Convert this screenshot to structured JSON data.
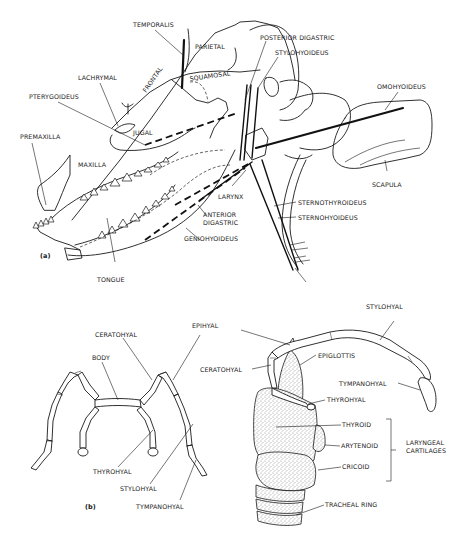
{
  "figure": {
    "panel_a": {
      "tag": "(a)",
      "labels": {
        "temporalis": "TEMPORALIS",
        "parietal": "PARIETAL",
        "frontal": "FRONTAL",
        "squamosal": "SQUAMOSAL",
        "lachrymal": "LACHRYMAL",
        "pterygoideus": "PTERYGOIDEUS",
        "jugal": "JUGAL",
        "premaxilla": "PREMAXILLA",
        "maxilla": "MAXILLA",
        "tongue": "TONGUE",
        "posterior_digastric": "POSTERIOR DIGASTRIC",
        "stylohyoideus": "STYLOHYOIDEUS",
        "omohyoideus": "OMOHYOIDEUS",
        "scapula": "SCAPULA",
        "larynx": "LARYNX",
        "anterior_digastric_1": "ANTERIOR",
        "anterior_digastric_2": "DIGASTRIC",
        "geniohyoideus": "GENIOHYOIDEUS",
        "sternothyroideus": "STERNOTHYROIDEUS",
        "sternohyoideus": "STERNOHYOIDEUS"
      }
    },
    "panel_b": {
      "tag": "(b)",
      "left_labels": {
        "ceratohyal": "CERATOHYAL",
        "body": "BODY",
        "thyrohyal": "THYROHYAL",
        "stylohyal": "STYLOHYAL",
        "tympanohyal": "TYMPANOHYAL"
      },
      "right_labels": {
        "epihyal": "EPIHYAL",
        "ceratohyal": "CERATOHYAL",
        "stylohyal": "STYLOHYAL",
        "epiglottis": "EPIGLOTTIS",
        "tympanohyal": "TYMPANOHYAL",
        "thyrohyal": "THYROHYAL",
        "thyroid": "THYROID",
        "arytenoid": "ARYTENOID",
        "cricoid": "CRICOID",
        "tracheal_ring": "TRACHEAL RING",
        "laryngeal_1": "LARYNGEAL",
        "laryngeal_2": "CARTILAGES"
      }
    }
  }
}
